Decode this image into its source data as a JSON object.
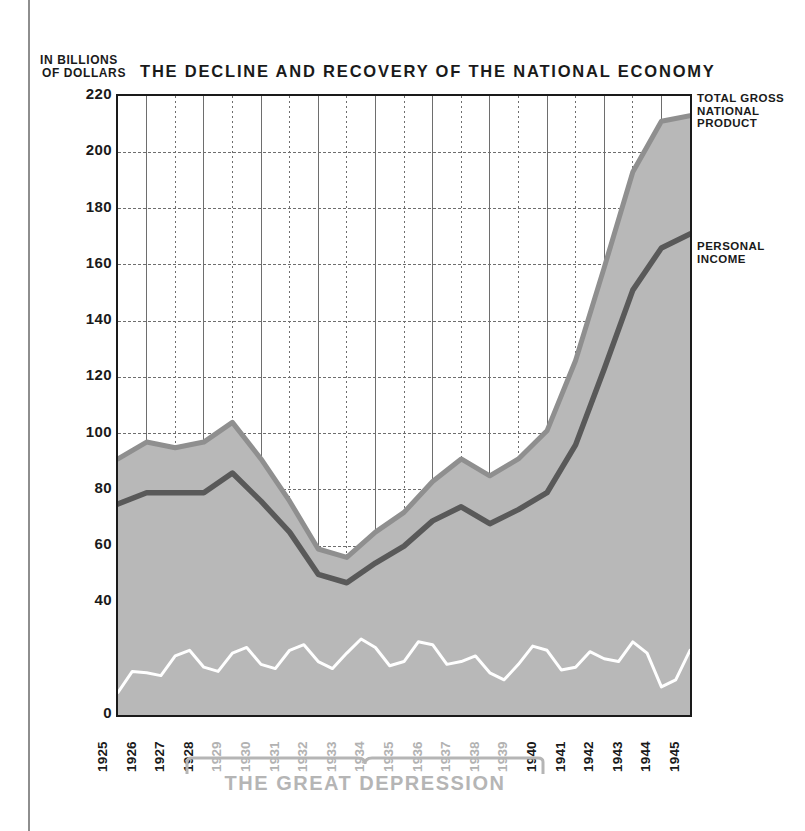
{
  "figure": {
    "title": "THE DECLINE AND RECOVERY OF THE NATIONAL ECONOMY",
    "y_axis_caption_line1": "IN BILLIONS",
    "y_axis_caption_line2": "OF DOLLARS",
    "annotation_bracket_label": "THE GREAT DEPRESSION",
    "series_label_gnp_line1": "TOTAL GROSS",
    "series_label_gnp_line2": "NATIONAL",
    "series_label_gnp_line3": "PRODUCT",
    "series_label_pi_line1": "PERSONAL",
    "series_label_pi_line2": "INCOME"
  },
  "colors": {
    "area_fill": "#b8b8b8",
    "gnp_line": "#8f8f8f",
    "personal_income_line": "#595959",
    "third_line": "#ffffff",
    "axis": "#1a1a1a",
    "grid": "#6e6e6e",
    "depression_text": "#b5b5b5",
    "depression_years_text": "#b2b2b2",
    "page_rule": "#8e8e8e"
  },
  "chart_data": {
    "type": "area",
    "title": "THE DECLINE AND RECOVERY OF THE NATIONAL ECONOMY",
    "xlabel": "",
    "ylabel": "IN BILLIONS OF DOLLARS",
    "ylim": [
      0,
      220
    ],
    "ytick_step": 20,
    "yticks": [
      0,
      20,
      40,
      60,
      80,
      100,
      120,
      140,
      160,
      180,
      200,
      220
    ],
    "ytick_labels_shown": [
      "0",
      "40",
      "60",
      "80",
      "100",
      "120",
      "140",
      "160",
      "180",
      "200",
      "220"
    ],
    "grid": true,
    "legend_position": "right-callout",
    "categories": [
      "1925",
      "1926",
      "1927",
      "1928",
      "1929",
      "1930",
      "1931",
      "1932",
      "1933",
      "1934",
      "1935",
      "1936",
      "1937",
      "1938",
      "1939",
      "1940",
      "1941",
      "1942",
      "1943",
      "1944",
      "1945"
    ],
    "depression_years": [
      "1929",
      "1930",
      "1931",
      "1932",
      "1933",
      "1934",
      "1935",
      "1936",
      "1937",
      "1938",
      "1939"
    ],
    "normal_years": [
      "1925",
      "1926",
      "1927",
      "1928",
      "1940",
      "1941",
      "1942",
      "1943",
      "1944",
      "1945"
    ],
    "series": [
      {
        "name": "TOTAL GROSS NATIONAL PRODUCT",
        "values": [
          91,
          97,
          95,
          97,
          104,
          91,
          76,
          59,
          56,
          65,
          72,
          83,
          91,
          85,
          91,
          101,
          126,
          159,
          193,
          211,
          213
        ]
      },
      {
        "name": "PERSONAL INCOME",
        "values": [
          75,
          79,
          79,
          79,
          86,
          76,
          65,
          50,
          47,
          54,
          60,
          69,
          74,
          68,
          73,
          79,
          96,
          123,
          151,
          166,
          171
        ]
      },
      {
        "name": "lower detail line",
        "values": [
          8,
          15,
          21,
          17,
          22,
          18,
          23,
          19,
          22,
          24,
          19,
          25,
          19,
          15,
          18,
          23,
          17,
          20,
          26,
          10,
          23
        ]
      }
    ]
  }
}
